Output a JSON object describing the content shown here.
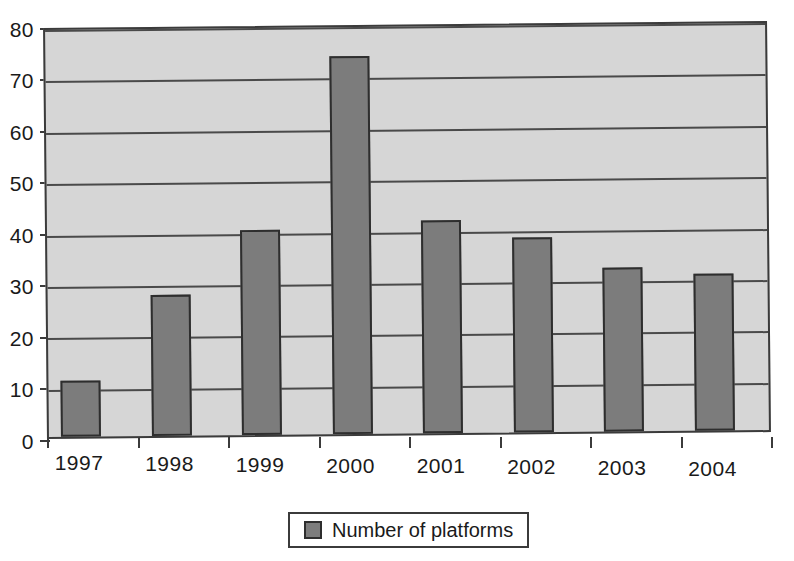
{
  "chart_data": {
    "type": "bar",
    "title": "",
    "subtitle": "",
    "xlabel": "",
    "ylabel": "",
    "categories": [
      "1997",
      "1998",
      "1999",
      "2000",
      "2001",
      "2002",
      "2003",
      "2004"
    ],
    "series": [
      {
        "name": "Number of platforms",
        "values": [
          11,
          27.5,
          40,
          73.5,
          41.5,
          38,
          32,
          30.5
        ]
      }
    ],
    "values": [
      11,
      27.5,
      40,
      73.5,
      41.5,
      38,
      32,
      30.5
    ],
    "ylim": [
      0,
      80
    ],
    "ytick_step": 10,
    "yticks": [
      0,
      10,
      20,
      30,
      40,
      50,
      60,
      70,
      80
    ],
    "ytick_labels": [
      "0",
      "10",
      "20",
      "30",
      "40",
      "50",
      "60",
      "70",
      "80"
    ],
    "grid": "horizontal",
    "legend_position": "bottom",
    "legend_entries": [
      "Number of platforms"
    ],
    "annotations": []
  },
  "legend": {
    "label": "Number of platforms",
    "swatch_name": "legend-color-swatch"
  },
  "colors": {
    "bar_fill": "#7c7c7c",
    "bar_border": "#2e2e2e",
    "plot_background": "#d6d6d6",
    "plot_border": "#3b3b3b",
    "gridline": "#4a4a4a",
    "page_background": "#ffffff",
    "text": "#1a1a1a"
  }
}
